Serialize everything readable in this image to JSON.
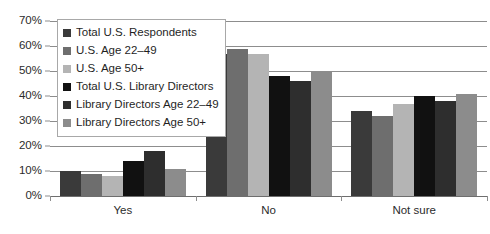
{
  "chart_data": {
    "type": "bar",
    "title": "",
    "subtitle": "",
    "xlabel": "",
    "ylabel": "",
    "categories": [
      "Yes",
      "No",
      "Not sure"
    ],
    "ylim": [
      0,
      70
    ],
    "ytick_labels": [
      "70%",
      "60%",
      "50%",
      "40%",
      "30%",
      "20%",
      "10%",
      "0%"
    ],
    "ytick_values": [
      70,
      60,
      50,
      40,
      30,
      20,
      10,
      0
    ],
    "ytick_suffix": "%",
    "grid": true,
    "legend_position": "upper-left-inside",
    "series": [
      {
        "name": "Total U.S. Respondents",
        "color": "#3a3a3a",
        "values": [
          10,
          57,
          34
        ]
      },
      {
        "name": "U.S. Age 22–49",
        "color": "#6e6e6e",
        "values": [
          9,
          59,
          32
        ]
      },
      {
        "name": "U.S. Age 50+",
        "color": "#b4b4b4",
        "values": [
          8,
          57,
          37
        ]
      },
      {
        "name": "Total U.S. Library Directors",
        "color": "#111111",
        "values": [
          14,
          48,
          40
        ]
      },
      {
        "name": "Library Directors Age 22–49",
        "color": "#2e2e2e",
        "values": [
          18,
          46,
          38
        ]
      },
      {
        "name": "Library Directors Age 50+",
        "color": "#8c8c8c",
        "values": [
          11,
          50,
          41
        ]
      }
    ]
  }
}
